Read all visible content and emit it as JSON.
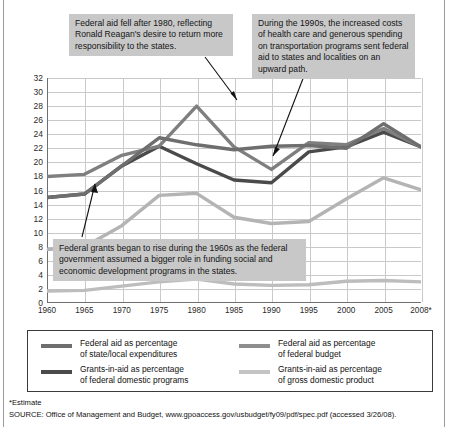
{
  "chart_data": {
    "type": "line",
    "title": "",
    "xlabel": "",
    "ylabel": "PERCENTAGE",
    "x": [
      1960,
      1965,
      1970,
      1975,
      1980,
      1985,
      1990,
      1995,
      2000,
      2005,
      2008
    ],
    "xtick_labels": [
      "1960",
      "1965",
      "1970",
      "1975",
      "1980",
      "1985",
      "1990",
      "1995",
      "2000",
      "2005",
      "2008*"
    ],
    "ylim": [
      0,
      32
    ],
    "ytick_labels": [
      "0",
      "2",
      "4",
      "6",
      "8",
      "10",
      "12",
      "14",
      "16",
      "18",
      "20",
      "22",
      "24",
      "26",
      "28",
      "30",
      "32"
    ],
    "ytick_values": [
      0,
      2,
      4,
      6,
      8,
      10,
      12,
      14,
      16,
      18,
      20,
      22,
      24,
      26,
      28,
      30,
      32
    ],
    "grid": true,
    "legend_position": "bottom",
    "series": [
      {
        "name": "Federal aid as percentage of state/local expenditures",
        "color": "#6e6e6e",
        "values": [
          15.0,
          15.5,
          19.5,
          23.5,
          22.5,
          21.8,
          22.3,
          22.4,
          22.0,
          25.5,
          22.2
        ]
      },
      {
        "name": "Federal aid as percentage of federal budget",
        "color": "#7f7f7f",
        "values": [
          18.0,
          18.3,
          21.0,
          22.3,
          28.0,
          22.2,
          19.0,
          22.8,
          22.5,
          24.8,
          22.2
        ]
      },
      {
        "name": "Grants-in-aid as percentage of federal domestic programs",
        "color": "#4a4a4a",
        "values": [
          15.0,
          15.5,
          19.5,
          22.3,
          19.8,
          17.5,
          17.1,
          21.5,
          22.2,
          24.3,
          22.2
        ]
      },
      {
        "name": "Grants-in-aid as percentage of gross domestic product",
        "color": "#b4b4b4",
        "values": [
          7.6,
          8.0,
          11.0,
          15.3,
          15.6,
          12.2,
          11.3,
          11.6,
          14.8,
          17.8,
          16.1
        ]
      },
      {
        "name": "Grants-in-aid lower band",
        "color": "#bdbdbd",
        "values": [
          1.7,
          1.8,
          2.4,
          3.0,
          3.4,
          2.7,
          2.5,
          2.6,
          3.1,
          3.2,
          3.0
        ]
      }
    ]
  },
  "figure": {
    "y_axis_title": "PERCENTAGE",
    "annotations": [
      {
        "id": "reagan",
        "text": "Federal aid fell after 1980, reflecting Ronald Reagan's desire to return more responsibility to the states."
      },
      {
        "id": "nineties",
        "text": "During the 1990s, the increased costs of health care and generous spending on transportation programs sent federal aid to states and localities on an upward path."
      },
      {
        "id": "sixties",
        "text": "Federal grants began to rise during the 1960s as the federal  government assumed a bigger role in funding social and economic development programs in the states."
      }
    ]
  },
  "legend": {
    "items": [
      {
        "line1": "Federal aid as percentage",
        "line2": "of state/local expenditures",
        "color": "#6e6e6e"
      },
      {
        "line1": "Grants-in-aid as percentage",
        "line2": "of federal domestic programs",
        "color": "#4a4a4a"
      },
      {
        "line1": "Federal aid as percentage",
        "line2": "of federal budget",
        "color": "#8e8e8e"
      },
      {
        "line1": "Grants-in-aid as percentage",
        "line2": "of gross domestic product",
        "color": "#c4c4c4"
      }
    ]
  },
  "footnotes": {
    "estimate": "*Estimate",
    "source": "SOURCE: Office of Management and Budget, www.gpoaccess.gov/usbudget/fy09/pdf/spec.pdf (accessed 3/26/08)."
  }
}
